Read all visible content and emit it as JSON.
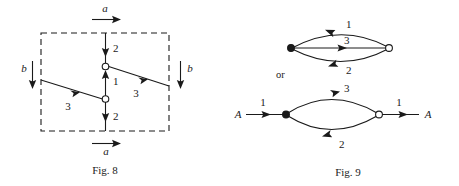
{
  "figures": [
    {
      "id": "fig-8",
      "caption": "Fig. 8",
      "boundary": "dashed-rectangle",
      "external_labels": [
        {
          "name": "top-a",
          "text": "a",
          "direction": "right",
          "position": "top"
        },
        {
          "name": "bottom-a",
          "text": "a",
          "direction": "right",
          "position": "bottom"
        },
        {
          "name": "left-b",
          "text": "b",
          "direction": "down",
          "position": "left"
        },
        {
          "name": "right-b",
          "text": "b",
          "direction": "down",
          "position": "right"
        }
      ],
      "nodes": [
        {
          "name": "upper-node",
          "style": "open"
        },
        {
          "name": "lower-node",
          "style": "open"
        }
      ],
      "edges": [
        {
          "name": "top-vertical-edge",
          "label": "2",
          "direction": "down"
        },
        {
          "name": "middle-vertical-edge",
          "label": "1",
          "direction": "up"
        },
        {
          "name": "bottom-vertical-edge",
          "label": "2",
          "direction": "down"
        },
        {
          "name": "left-diagonal-edge",
          "label": "3",
          "direction": "right"
        },
        {
          "name": "right-diagonal-edge",
          "label": "3",
          "direction": "right"
        }
      ]
    },
    {
      "id": "fig-9",
      "caption": "Fig. 9",
      "connector_text": "or",
      "graphs": [
        {
          "name": "upper-graph",
          "nodes": [
            {
              "name": "left-node",
              "style": "filled"
            },
            {
              "name": "right-node",
              "style": "open"
            }
          ],
          "edges": [
            {
              "name": "upper-arc-edge",
              "label": "1",
              "direction": "left"
            },
            {
              "name": "middle-straight-edge",
              "label": "3",
              "direction": "right"
            },
            {
              "name": "lower-arc-edge",
              "label": "2",
              "direction": "left"
            }
          ]
        },
        {
          "name": "lower-graph",
          "terminals": [
            {
              "name": "left-terminal",
              "text": "A"
            },
            {
              "name": "right-terminal",
              "text": "A"
            }
          ],
          "nodes": [
            {
              "name": "left-node",
              "style": "filled"
            },
            {
              "name": "right-node",
              "style": "open"
            }
          ],
          "edges": [
            {
              "name": "left-entry-edge",
              "label": "1",
              "direction": "right"
            },
            {
              "name": "upper-arc-edge",
              "label": "3",
              "direction": "right"
            },
            {
              "name": "lower-arc-edge",
              "label": "2",
              "direction": "left"
            },
            {
              "name": "right-exit-edge",
              "label": "1",
              "direction": "right"
            }
          ]
        }
      ]
    }
  ],
  "colors": {
    "ink": "#1a1a1a",
    "paper": "#ffffff"
  }
}
